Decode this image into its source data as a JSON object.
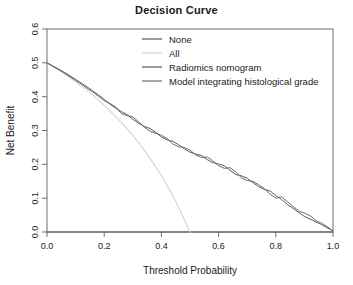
{
  "chart_data": {
    "type": "line",
    "title": "Decision Curve",
    "xlabel": "Threshold Probability",
    "ylabel": "Net Benefit",
    "xlim": [
      0.0,
      1.0
    ],
    "ylim": [
      0.0,
      0.6
    ],
    "xticks": [
      "0.0",
      "0.2",
      "0.4",
      "0.6",
      "0.8",
      "1.0"
    ],
    "xtick_values": [
      0.0,
      0.2,
      0.4,
      0.6,
      0.8,
      1.0
    ],
    "yticks": [
      "0.0",
      "0.1",
      "0.2",
      "0.3",
      "0.4",
      "0.5",
      "0.6"
    ],
    "ytick_values": [
      0.0,
      0.1,
      0.2,
      0.3,
      0.4,
      0.5,
      0.6
    ],
    "grid": false,
    "legend_position": "top-center",
    "series": [
      {
        "name": "None",
        "color": "#555555",
        "width": 1.1,
        "x": [
          0.0,
          1.0
        ],
        "values": [
          0.0,
          0.0
        ]
      },
      {
        "name": "All",
        "color": "#d2d2d2",
        "width": 1.1,
        "x": [
          0.0,
          0.05,
          0.1,
          0.15,
          0.2,
          0.25,
          0.3,
          0.35,
          0.4,
          0.45,
          0.5,
          0.51
        ],
        "values": [
          0.5,
          0.474,
          0.444,
          0.412,
          0.375,
          0.333,
          0.286,
          0.231,
          0.167,
          0.091,
          0.0,
          -0.02
        ]
      },
      {
        "name": "Radiomics nomogram",
        "color": "#595959",
        "width": 1.0,
        "x": [
          0.0,
          0.02,
          0.04,
          0.06,
          0.08,
          0.1,
          0.12,
          0.14,
          0.16,
          0.18,
          0.2,
          0.22,
          0.24,
          0.26,
          0.28,
          0.3,
          0.32,
          0.34,
          0.36,
          0.38,
          0.4,
          0.42,
          0.44,
          0.46,
          0.48,
          0.5,
          0.52,
          0.54,
          0.56,
          0.58,
          0.6,
          0.62,
          0.64,
          0.66,
          0.68,
          0.7,
          0.72,
          0.74,
          0.76,
          0.78,
          0.8,
          0.82,
          0.84,
          0.86,
          0.88,
          0.9,
          0.92,
          0.94,
          0.96,
          0.98,
          1.0
        ],
        "values": [
          0.5,
          0.491,
          0.482,
          0.472,
          0.462,
          0.451,
          0.44,
          0.429,
          0.417,
          0.405,
          0.392,
          0.378,
          0.366,
          0.356,
          0.347,
          0.333,
          0.322,
          0.312,
          0.306,
          0.295,
          0.281,
          0.272,
          0.268,
          0.258,
          0.246,
          0.236,
          0.23,
          0.226,
          0.214,
          0.205,
          0.201,
          0.196,
          0.182,
          0.17,
          0.166,
          0.159,
          0.146,
          0.134,
          0.126,
          0.121,
          0.108,
          0.096,
          0.082,
          0.07,
          0.058,
          0.046,
          0.038,
          0.03,
          0.022,
          0.012,
          0.004
        ]
      },
      {
        "name": "Model integrating histological grade",
        "color": "#6b6b6b",
        "width": 1.0,
        "x": [
          0.0,
          0.02,
          0.04,
          0.06,
          0.08,
          0.1,
          0.12,
          0.14,
          0.16,
          0.18,
          0.2,
          0.22,
          0.24,
          0.26,
          0.28,
          0.3,
          0.32,
          0.34,
          0.36,
          0.38,
          0.4,
          0.42,
          0.44,
          0.46,
          0.48,
          0.5,
          0.52,
          0.54,
          0.56,
          0.58,
          0.6,
          0.62,
          0.64,
          0.66,
          0.68,
          0.7,
          0.72,
          0.74,
          0.76,
          0.78,
          0.8,
          0.82,
          0.84,
          0.86,
          0.88,
          0.9,
          0.92,
          0.94,
          0.96,
          0.98,
          1.0
        ],
        "values": [
          0.5,
          0.49,
          0.48,
          0.47,
          0.459,
          0.448,
          0.437,
          0.425,
          0.414,
          0.401,
          0.388,
          0.38,
          0.37,
          0.35,
          0.344,
          0.34,
          0.326,
          0.31,
          0.298,
          0.292,
          0.286,
          0.276,
          0.26,
          0.252,
          0.25,
          0.242,
          0.228,
          0.22,
          0.222,
          0.21,
          0.196,
          0.188,
          0.19,
          0.178,
          0.16,
          0.152,
          0.15,
          0.14,
          0.128,
          0.112,
          0.1,
          0.104,
          0.09,
          0.076,
          0.062,
          0.056,
          0.048,
          0.034,
          0.026,
          0.016,
          0.002
        ]
      }
    ],
    "legend": [
      {
        "label": "None",
        "color": "#555555"
      },
      {
        "label": "All",
        "color": "#d2d2d2"
      },
      {
        "label": "Radiomics nomogram",
        "color": "#595959"
      },
      {
        "label": "Model integrating histological grade",
        "color": "#6b6b6b"
      }
    ]
  }
}
